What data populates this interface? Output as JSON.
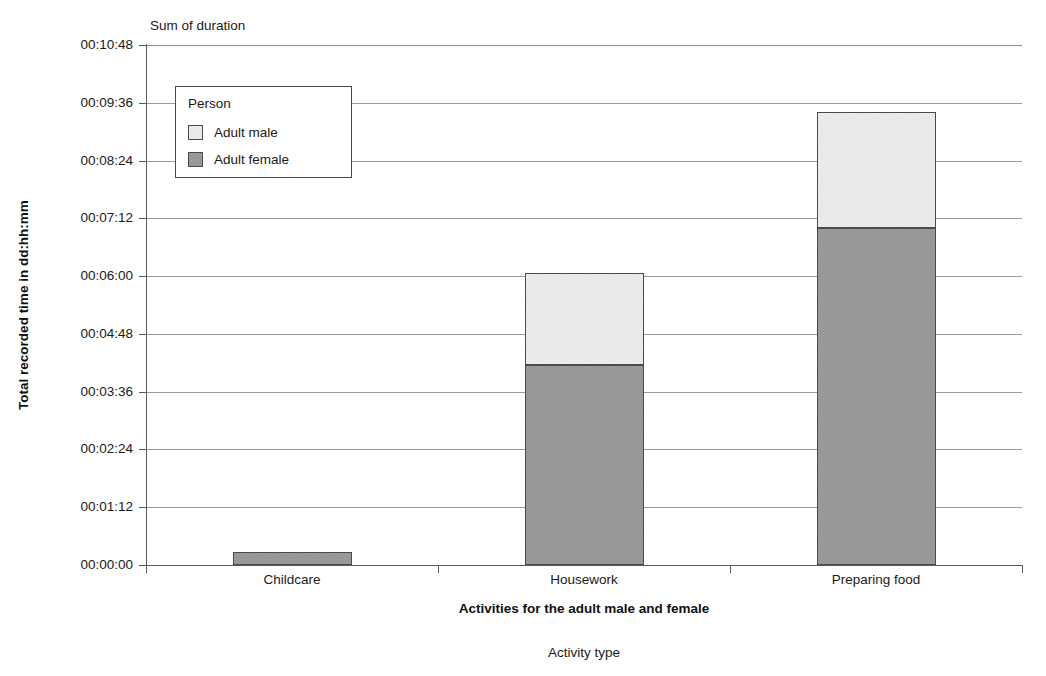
{
  "chart_data": {
    "type": "bar",
    "subtype": "stacked-vertical",
    "title": "",
    "plot_caption": "Sum of duration",
    "xlabel": "Activities for the adult male and female",
    "outer_xlabel": "Activity type",
    "ylabel": "Total recorded time in dd:hh:mm",
    "categories": [
      "Childcare",
      "Housework",
      "Preparing food"
    ],
    "ytick_labels": [
      "00:00:00",
      "00:01:12",
      "00:02:24",
      "00:03:36",
      "00:04:48",
      "00:06:00",
      "00:07:12",
      "00:08:24",
      "00:09:36",
      "00:10:48"
    ],
    "ytick_minutes": [
      0,
      72,
      144,
      216,
      288,
      360,
      432,
      504,
      576,
      648
    ],
    "ylim_minutes": [
      0,
      648
    ],
    "grid": true,
    "legend_position": "upper-left-inside",
    "series": [
      {
        "name": "Adult female",
        "color": "#8c8c8c",
        "values_minutes": [
          16,
          249,
          420
        ],
        "values_formatted": [
          "00:00:16",
          "00:04:09",
          "00:07:00"
        ]
      },
      {
        "name": "Adult male",
        "color": "#dedede",
        "values_minutes": [
          0,
          115,
          145
        ],
        "values_formatted": [
          "00:00:00",
          "00:01:55",
          "00:02:25"
        ]
      }
    ],
    "totals_minutes": [
      16,
      364,
      565
    ],
    "totals_formatted": [
      "00:00:16",
      "00:06:04",
      "00:09:25"
    ],
    "stack_order": [
      "Adult female",
      "Adult male"
    ]
  },
  "legend": {
    "title": "Person",
    "items": [
      {
        "label": "Adult male",
        "color": "#dedede"
      },
      {
        "label": "Adult female",
        "color": "#8c8c8c"
      }
    ]
  }
}
